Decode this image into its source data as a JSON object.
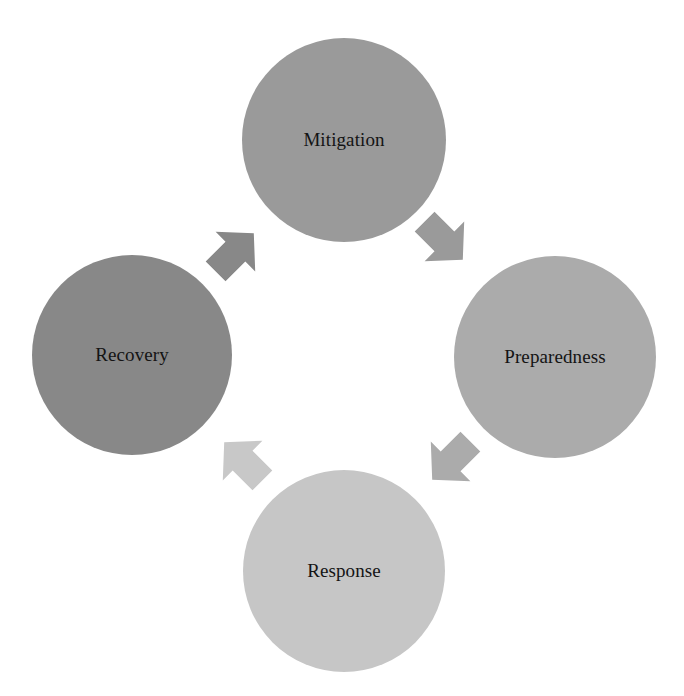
{
  "diagram": {
    "type": "cycle",
    "title": "",
    "nodes": [
      {
        "id": "mitigation",
        "label": "Mitigation",
        "color": "#9a9a9a",
        "cx": 344,
        "cy": 140,
        "r": 102
      },
      {
        "id": "preparedness",
        "label": "Preparedness",
        "color": "#ababab",
        "cx": 555,
        "cy": 357,
        "r": 101
      },
      {
        "id": "response",
        "label": "Response",
        "color": "#c6c6c6",
        "cx": 344,
        "cy": 571,
        "r": 101
      },
      {
        "id": "recovery",
        "label": "Recovery",
        "color": "#888888",
        "cx": 132,
        "cy": 355,
        "r": 100
      }
    ],
    "edges": [
      {
        "from": "mitigation",
        "to": "preparedness",
        "direction": "south-east",
        "color": "#9a9a9a"
      },
      {
        "from": "preparedness",
        "to": "response",
        "direction": "south-west",
        "color": "#ababab"
      },
      {
        "from": "response",
        "to": "recovery",
        "direction": "north-west",
        "color": "#c8c8c8"
      },
      {
        "from": "recovery",
        "to": "mitigation",
        "direction": "north-east",
        "color": "#888888"
      }
    ]
  }
}
